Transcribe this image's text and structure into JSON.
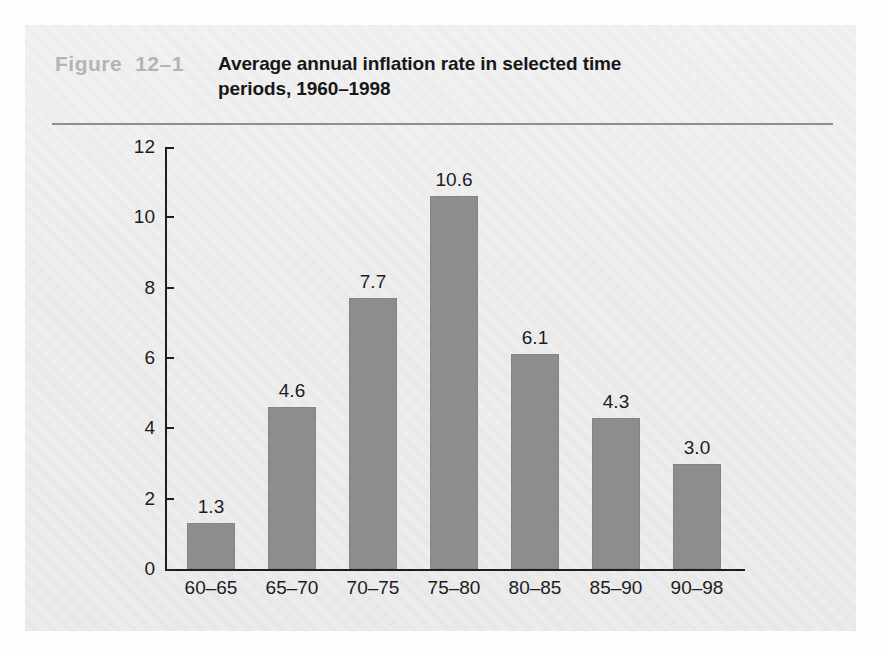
{
  "figure": {
    "label": "Figure",
    "number": "12–1"
  },
  "chart_data": {
    "type": "bar",
    "title": "Average annual inflation rate in selected time periods, 1960–1998",
    "title_line1": "Average annual inflation rate in selected time",
    "title_line2": "periods, 1960–1998",
    "xlabel": "",
    "ylabel": "",
    "categories": [
      "60–65",
      "65–70",
      "70–75",
      "75–80",
      "80–85",
      "85–90",
      "90–98"
    ],
    "values": [
      1.3,
      4.6,
      7.7,
      10.6,
      6.1,
      4.3,
      3.0
    ],
    "value_labels": [
      "1.3",
      "4.6",
      "7.7",
      "10.6",
      "6.1",
      "4.3",
      "3.0"
    ],
    "ylim": [
      0,
      12
    ],
    "yticks": [
      0,
      2,
      4,
      6,
      8,
      10,
      12
    ],
    "ytick_labels": [
      "0",
      "2",
      "4",
      "6",
      "8",
      "10",
      "12"
    ],
    "grid": false,
    "legend": null,
    "bar_color": "#8d8d8d",
    "axis_color": "#1d1d1f",
    "background_color": "#e9e9e9"
  }
}
